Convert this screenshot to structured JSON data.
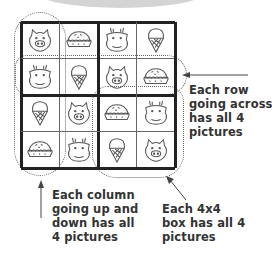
{
  "grid": {
    "rows": [
      [
        "pig",
        "pie",
        "cow",
        "icecream"
      ],
      [
        "cow",
        "icecream",
        "pig",
        "pie"
      ],
      [
        "icecream",
        "pig",
        "pie",
        "cow"
      ],
      [
        "pie",
        "cow",
        "icecream",
        "pig"
      ]
    ]
  },
  "annotations": {
    "row": {
      "lines": [
        "Each row",
        "going across",
        "has all 4",
        "pictures"
      ]
    },
    "column": {
      "lines": [
        "Each column",
        "going up and",
        "down has all",
        "4 pictures"
      ]
    },
    "box": {
      "lines": [
        "Each 4x4",
        "box has all 4",
        "pictures"
      ]
    }
  },
  "colors": {
    "line": "#222222",
    "icon": "#555555",
    "text": "#333333",
    "arc": "#d4d4d4"
  }
}
